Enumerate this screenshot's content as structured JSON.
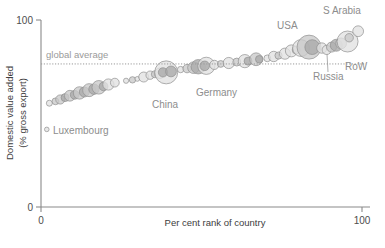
{
  "chart_data": {
    "type": "scatter",
    "title": "",
    "xlabel": "Per cent rank of country",
    "ylabel_line1": "Domestic value added",
    "ylabel_line2": "(% gross export)",
    "xlim": [
      0,
      100
    ],
    "ylim": [
      0,
      100
    ],
    "xticks": [
      "0",
      "100"
    ],
    "yticks": [
      "0",
      "100"
    ],
    "grid": false,
    "legend": false,
    "marker": "bubble",
    "bubble_size_meaning": "gross export size",
    "reference_line": {
      "label": "global average",
      "value": 76.5,
      "style": "dotted",
      "orientation": "horizontal"
    },
    "annotations": [
      {
        "label": "Luxembourg",
        "x": 2,
        "y": 41
      },
      {
        "label": "China",
        "x": 39,
        "y": 62
      },
      {
        "label": "Germany",
        "x": 58,
        "y": 66
      },
      {
        "label": "USA",
        "x": 84,
        "y": 93
      },
      {
        "label": "S Arabia",
        "x": 98,
        "y": 99
      },
      {
        "label": "RoW",
        "x": 98,
        "y": 76
      },
      {
        "label": "Russia",
        "x": 93,
        "y": 70
      }
    ],
    "points": [
      {
        "name": "Luxembourg",
        "x": 1.8,
        "y": 41.5,
        "r": 2.3,
        "tone": "light"
      },
      {
        "name": "p1",
        "x": 2.6,
        "y": 55.5,
        "r": 3.0,
        "tone": "light"
      },
      {
        "name": "p2",
        "x": 4.5,
        "y": 56.5,
        "r": 3.4,
        "tone": "mid"
      },
      {
        "name": "p3",
        "x": 6.0,
        "y": 57.5,
        "r": 4.6,
        "tone": "mid"
      },
      {
        "name": "p4",
        "x": 7.5,
        "y": 58.5,
        "r": 4.0,
        "tone": "dark"
      },
      {
        "name": "p5",
        "x": 9.0,
        "y": 59.5,
        "r": 5.4,
        "tone": "mid"
      },
      {
        "name": "p6",
        "x": 10.5,
        "y": 60.0,
        "r": 4.4,
        "tone": "dark"
      },
      {
        "name": "p7",
        "x": 12.0,
        "y": 61.0,
        "r": 6.2,
        "tone": "mid"
      },
      {
        "name": "p8",
        "x": 13.5,
        "y": 61.5,
        "r": 5.0,
        "tone": "dark"
      },
      {
        "name": "p9",
        "x": 15.0,
        "y": 62.5,
        "r": 6.5,
        "tone": "mid"
      },
      {
        "name": "p10",
        "x": 16.5,
        "y": 63.0,
        "r": 5.2,
        "tone": "dark"
      },
      {
        "name": "p11",
        "x": 18.0,
        "y": 64.0,
        "r": 6.8,
        "tone": "mid"
      },
      {
        "name": "p12",
        "x": 19.5,
        "y": 64.5,
        "r": 4.4,
        "tone": "dark"
      },
      {
        "name": "p13",
        "x": 21.0,
        "y": 65.5,
        "r": 5.6,
        "tone": "light"
      },
      {
        "name": "p14",
        "x": 23.0,
        "y": 66.5,
        "r": 4.4,
        "tone": "light"
      },
      {
        "name": "p15",
        "x": 26.5,
        "y": 67.5,
        "r": 2.6,
        "tone": "light"
      },
      {
        "name": "p16",
        "x": 28.5,
        "y": 68.0,
        "r": 3.2,
        "tone": "mid"
      },
      {
        "name": "p17",
        "x": 30.0,
        "y": 68.5,
        "r": 2.4,
        "tone": "light"
      },
      {
        "name": "p18",
        "x": 32.0,
        "y": 69.5,
        "r": 5.0,
        "tone": "light"
      },
      {
        "name": "p19",
        "x": 34.0,
        "y": 70.5,
        "r": 4.2,
        "tone": "light"
      },
      {
        "name": "p20",
        "x": 35.5,
        "y": 71.0,
        "r": 3.6,
        "tone": "mid"
      },
      {
        "name": "p21",
        "x": 37.0,
        "y": 71.5,
        "r": 5.2,
        "tone": "light"
      },
      {
        "name": "China",
        "x": 39.0,
        "y": 72.0,
        "r": 11.5,
        "tone": "light"
      },
      {
        "name": "China-inner",
        "x": 38.0,
        "y": 72.0,
        "r": 4.6,
        "tone": "dark"
      },
      {
        "name": "p22",
        "x": 40.5,
        "y": 72.5,
        "r": 5.4,
        "tone": "dark"
      },
      {
        "name": "p23",
        "x": 43.5,
        "y": 73.5,
        "r": 3.2,
        "tone": "light"
      },
      {
        "name": "p24",
        "x": 45.5,
        "y": 74.0,
        "r": 4.2,
        "tone": "mid"
      },
      {
        "name": "p25",
        "x": 47.5,
        "y": 74.5,
        "r": 5.8,
        "tone": "mid"
      },
      {
        "name": "p26",
        "x": 49.0,
        "y": 75.0,
        "r": 7.2,
        "tone": "dark"
      },
      {
        "name": "Germany",
        "x": 51.5,
        "y": 75.5,
        "r": 8.6,
        "tone": "light"
      },
      {
        "name": "Germany-inner",
        "x": 51.0,
        "y": 75.5,
        "r": 4.8,
        "tone": "dark"
      },
      {
        "name": "p27",
        "x": 54.0,
        "y": 76.0,
        "r": 4.6,
        "tone": "light"
      },
      {
        "name": "p28",
        "x": 56.0,
        "y": 76.5,
        "r": 3.4,
        "tone": "mid"
      },
      {
        "name": "p29",
        "x": 58.5,
        "y": 77.0,
        "r": 5.6,
        "tone": "light"
      },
      {
        "name": "p30",
        "x": 61.0,
        "y": 77.5,
        "r": 4.0,
        "tone": "mid"
      },
      {
        "name": "p31",
        "x": 63.5,
        "y": 78.0,
        "r": 6.6,
        "tone": "light"
      },
      {
        "name": "p32",
        "x": 64.5,
        "y": 78.0,
        "r": 4.0,
        "tone": "dark"
      },
      {
        "name": "p33",
        "x": 67.0,
        "y": 79.0,
        "r": 6.4,
        "tone": "mid"
      },
      {
        "name": "p34",
        "x": 68.0,
        "y": 79.0,
        "r": 3.8,
        "tone": "dark"
      },
      {
        "name": "p35",
        "x": 70.5,
        "y": 79.5,
        "r": 3.4,
        "tone": "light"
      },
      {
        "name": "p36",
        "x": 72.5,
        "y": 80.5,
        "r": 5.2,
        "tone": "light"
      },
      {
        "name": "p37",
        "x": 74.0,
        "y": 81.0,
        "r": 3.6,
        "tone": "mid"
      },
      {
        "name": "p38",
        "x": 76.0,
        "y": 82.0,
        "r": 5.6,
        "tone": "light"
      },
      {
        "name": "p39",
        "x": 78.0,
        "y": 83.5,
        "r": 6.0,
        "tone": "light"
      },
      {
        "name": "p40",
        "x": 79.5,
        "y": 84.0,
        "r": 4.0,
        "tone": "mid"
      },
      {
        "name": "p41",
        "x": 81.0,
        "y": 85.0,
        "r": 8.4,
        "tone": "light"
      },
      {
        "name": "USA",
        "x": 83.5,
        "y": 85.5,
        "r": 12.0,
        "tone": "mid"
      },
      {
        "name": "USA-inner",
        "x": 84.5,
        "y": 85.5,
        "r": 7.4,
        "tone": "dark"
      },
      {
        "name": "p42",
        "x": 87.5,
        "y": 85.0,
        "r": 5.2,
        "tone": "light"
      },
      {
        "name": "Russia",
        "x": 89.0,
        "y": 84.0,
        "r": 4.6,
        "tone": "light"
      },
      {
        "name": "p43",
        "x": 90.5,
        "y": 85.5,
        "r": 5.0,
        "tone": "mid"
      },
      {
        "name": "p44",
        "x": 92.0,
        "y": 86.5,
        "r": 6.0,
        "tone": "dark"
      },
      {
        "name": "p45",
        "x": 93.5,
        "y": 87.5,
        "r": 5.4,
        "tone": "mid"
      },
      {
        "name": "RoW",
        "x": 95.5,
        "y": 88.5,
        "r": 10.5,
        "tone": "light"
      },
      {
        "name": "p46",
        "x": 96.0,
        "y": 90.5,
        "r": 4.2,
        "tone": "mid"
      },
      {
        "name": "S Arabia",
        "x": 98.8,
        "y": 94.0,
        "r": 5.4,
        "tone": "light"
      }
    ]
  },
  "colors": {
    "bubble_light": "#e2e2e2",
    "bubble_mid": "#c9c9c9",
    "bubble_dark": "#a9a9a9",
    "bubble_stroke": "#8f8f8f",
    "axis": "#8a8a8a",
    "text": "#3d3d3d",
    "annotation": "#8d8d8d",
    "avg_line": "#9a9a9a",
    "background": "#ffffff"
  }
}
